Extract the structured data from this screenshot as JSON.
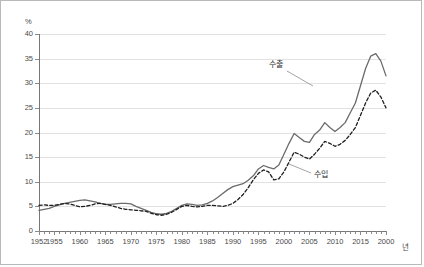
{
  "figure": {
    "unit_label": "%",
    "xaxis_unit_label": "년"
  },
  "annotations": [
    {
      "name": "export-series-label",
      "text": "수출",
      "x": 268,
      "y": 62
    },
    {
      "name": "import-series-label",
      "text": "수입",
      "x": 312,
      "y": 172
    }
  ],
  "chart_data": {
    "type": "line",
    "title": "",
    "xlabel": "년",
    "ylabel": "%",
    "ylim": [
      0,
      40
    ],
    "xlim": [
      1952,
      2020
    ],
    "ytick_labels": [
      "0",
      "5",
      "10",
      "15",
      "20",
      "25",
      "30",
      "35",
      "40"
    ],
    "ytick_values": [
      0,
      5,
      10,
      15,
      20,
      25,
      30,
      35,
      40
    ],
    "xtick_labels": [
      "1952",
      "1955",
      "1960",
      "1965",
      "1970",
      "1975",
      "1980",
      "1985",
      "1990",
      "1995",
      "2000",
      "2005",
      "2010",
      "2015",
      "2000"
    ],
    "xtick_values": [
      1952,
      1955,
      1960,
      1965,
      1970,
      1975,
      1980,
      1985,
      1990,
      1995,
      2000,
      2005,
      2010,
      2015,
      2020
    ],
    "grid": "horizontal",
    "legend_position": "inline-annotation",
    "x": [
      1952,
      1953,
      1954,
      1955,
      1956,
      1957,
      1958,
      1959,
      1960,
      1961,
      1962,
      1963,
      1964,
      1965,
      1966,
      1967,
      1968,
      1969,
      1970,
      1971,
      1972,
      1973,
      1974,
      1975,
      1976,
      1977,
      1978,
      1979,
      1980,
      1981,
      1982,
      1983,
      1984,
      1985,
      1986,
      1987,
      1988,
      1989,
      1990,
      1991,
      1992,
      1993,
      1994,
      1995,
      1996,
      1997,
      1998,
      1999,
      2000,
      2001,
      2002,
      2003,
      2004,
      2005,
      2006,
      2007,
      2008,
      2009,
      2010,
      2011,
      2012,
      2013,
      2014,
      2015,
      2016,
      2017,
      2018,
      2019,
      2020
    ],
    "series": [
      {
        "name": "수출",
        "style": "solid",
        "color": "#666666",
        "values": [
          4.2,
          4.4,
          4.6,
          5.0,
          5.3,
          5.6,
          5.8,
          6.0,
          6.2,
          6.3,
          6.1,
          5.9,
          5.6,
          5.4,
          5.4,
          5.5,
          5.6,
          5.6,
          5.5,
          5.0,
          4.6,
          4.2,
          3.8,
          3.5,
          3.4,
          3.6,
          4.0,
          4.6,
          5.2,
          5.5,
          5.4,
          5.2,
          5.3,
          5.6,
          6.1,
          6.8,
          7.6,
          8.4,
          9.0,
          9.3,
          9.6,
          10.3,
          11.2,
          12.6,
          13.3,
          12.9,
          12.6,
          13.4,
          15.6,
          17.8,
          19.8,
          19.0,
          18.2,
          18.0,
          19.6,
          20.5,
          22.0,
          21.0,
          20.2,
          21.0,
          22.0,
          24.0,
          26.0,
          29.5,
          33.0,
          35.5,
          36.0,
          34.5,
          31.5
        ]
      },
      {
        "name": "수입",
        "style": "dashed",
        "color": "#1a1a1a",
        "values": [
          5.2,
          5.3,
          5.2,
          5.2,
          5.4,
          5.6,
          5.5,
          5.2,
          4.9,
          5.0,
          5.2,
          5.5,
          5.6,
          5.4,
          5.2,
          4.9,
          4.6,
          4.4,
          4.3,
          4.2,
          4.1,
          4.0,
          3.6,
          3.3,
          3.2,
          3.4,
          3.8,
          4.4,
          5.0,
          5.2,
          5.0,
          4.9,
          5.0,
          5.2,
          5.2,
          5.1,
          5.0,
          5.2,
          5.6,
          6.4,
          7.4,
          8.8,
          10.4,
          11.7,
          12.4,
          12.0,
          10.4,
          10.6,
          12.0,
          14.0,
          16.0,
          15.6,
          15.0,
          14.6,
          15.6,
          16.8,
          18.2,
          17.8,
          17.2,
          17.6,
          18.4,
          19.6,
          21.0,
          23.5,
          26.0,
          28.0,
          28.6,
          27.2,
          25.0
        ]
      }
    ],
    "series_tail": {
      "note": "Values continue to 2020 in the plotted line paths",
      "export_final": 18.0,
      "import_final": 14.5,
      "export_peak": 36.0,
      "export_peak_year": 2008,
      "import_peak": 28.6,
      "import_peak_year": 2018
    }
  }
}
